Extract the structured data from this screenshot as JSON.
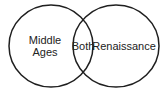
{
  "diagram": {
    "type": "venn",
    "title": "",
    "left_label": "Middle Ages",
    "overlap_label": "Both",
    "right_label": "Renaissance",
    "stroke_color": "#1f1f1f",
    "text_color": "#222222",
    "background_color": "#ffffff"
  }
}
